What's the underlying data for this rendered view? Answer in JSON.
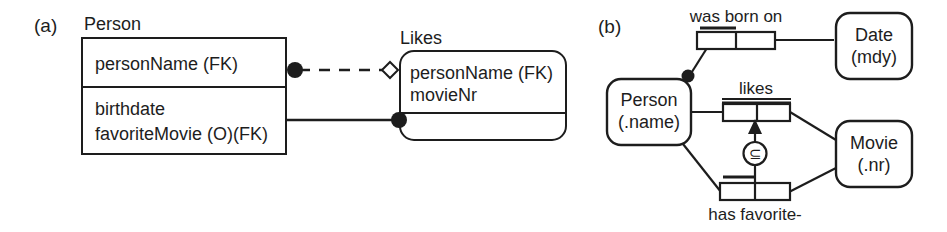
{
  "figure": {
    "background_color": "#ffffff",
    "line_color": "#1d1d1d",
    "text_color": "#1d1d1d"
  },
  "panel_a": {
    "label": "(a)",
    "type": "relational-schema",
    "tables": [
      {
        "name": "Person",
        "title": "Person",
        "rows": [
          {
            "text": "personName (FK)"
          },
          {
            "text": "birthdate"
          },
          {
            "text": "favoriteMovie (O)(FK)"
          }
        ],
        "shape": "rectangle"
      },
      {
        "name": "Likes",
        "title": "Likes",
        "rows": [
          {
            "text": "personName (FK)"
          },
          {
            "text": "movieNr"
          }
        ],
        "shape": "rounded-rectangle"
      }
    ],
    "connectors": [
      {
        "name": "person-likes-optional",
        "style": "dashed",
        "source_marker": "filled-circle",
        "target_marker": "open-diamond"
      },
      {
        "name": "person-likes-mandatory",
        "style": "solid",
        "source_marker": "none",
        "target_marker": "filled-circle"
      }
    ]
  },
  "panel_b": {
    "label": "(b)",
    "type": "orm-diagram",
    "entities": [
      {
        "name": "person",
        "line1": "Person",
        "line2": "(.name)"
      },
      {
        "name": "date",
        "line1": "Date",
        "line2": "(mdy)"
      },
      {
        "name": "movie",
        "line1": "Movie",
        "line2": "(.nr)"
      }
    ],
    "fact_types": [
      {
        "name": "was-born-on",
        "label": "was born on",
        "roles": 2,
        "uniqueness": "first-role",
        "connects": [
          "person",
          "date"
        ]
      },
      {
        "name": "likes",
        "label": "likes",
        "roles": 2,
        "uniqueness": "spanning",
        "connects": [
          "person",
          "movie"
        ]
      },
      {
        "name": "has-favorite",
        "label": "has favorite-",
        "roles": 2,
        "uniqueness": "first-role",
        "connects": [
          "person",
          "movie"
        ]
      }
    ],
    "constraints": [
      {
        "name": "mandatory-role-dot",
        "kind": "mandatory-role",
        "glyph": "filled-circle",
        "on": "person"
      },
      {
        "name": "subset-constraint",
        "kind": "subset",
        "glyph": "⊆",
        "from": "has-favorite",
        "to": "likes"
      }
    ]
  }
}
